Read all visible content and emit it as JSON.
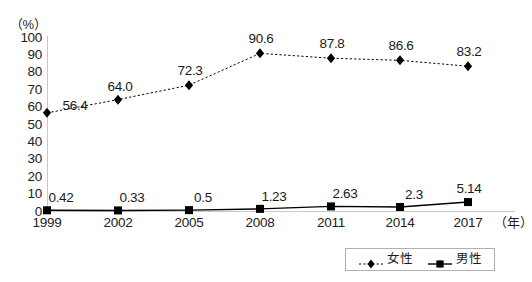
{
  "axis": {
    "unit_label": "（%）",
    "x_unit_label": "（年）",
    "y_ticks": [
      "100",
      "90",
      "80",
      "70",
      "60",
      "50",
      "40",
      "30",
      "20",
      "10",
      "0"
    ],
    "x_ticks": [
      "1999",
      "2002",
      "2005",
      "2008",
      "2011",
      "2014",
      "2017"
    ]
  },
  "legend": {
    "items": [
      {
        "label": "女性",
        "marker": "diamond-marker-icon",
        "line": "dotted"
      },
      {
        "label": "男性",
        "marker": "square-marker-icon",
        "line": "solid"
      }
    ]
  },
  "chart_data": {
    "type": "line",
    "title": "",
    "xlabel": "（年）",
    "ylabel": "（%）",
    "ylim": [
      0,
      100
    ],
    "ytick_step": 10,
    "grid": false,
    "legend_position": "bottom-right",
    "categories": [
      "1999",
      "2002",
      "2005",
      "2008",
      "2011",
      "2014",
      "2017"
    ],
    "series": [
      {
        "name": "女性",
        "marker": "diamond",
        "linestyle": "dotted",
        "color": "#000000",
        "values": [
          56.4,
          64.0,
          72.3,
          90.6,
          87.8,
          86.6,
          83.2
        ],
        "labels": [
          "56.4",
          "64.0",
          "72.3",
          "90.6",
          "87.8",
          "86.6",
          "83.2"
        ]
      },
      {
        "name": "男性",
        "marker": "square",
        "linestyle": "solid",
        "color": "#000000",
        "values": [
          0.42,
          0.33,
          0.5,
          1.23,
          2.63,
          2.3,
          5.14
        ],
        "labels": [
          "0.42",
          "0.33",
          "0.5",
          "1.23",
          "2.63",
          "2.3",
          "5.14"
        ]
      }
    ]
  }
}
